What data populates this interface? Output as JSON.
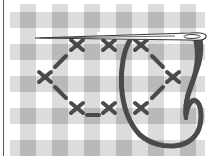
{
  "illustration": {
    "subject": "Needle and thread cross-stitching on gingham fabric",
    "caption": "",
    "colors": {
      "background": "#ffffff",
      "gingham_light": "#dcdcdc",
      "gingham_dark": "#b9b9b9",
      "thread": "#4a4a4a",
      "needle_outline": "#3a3a3a",
      "needle_fill": "#ffffff",
      "border": "#555555"
    },
    "gingham": {
      "horizontal_bands_y": [
        12,
        44,
        76,
        108,
        140
      ],
      "vertical_bands_x": [
        20,
        52,
        84,
        116,
        148,
        180
      ],
      "band_size": 16
    },
    "stitches": {
      "crosses": [
        {
          "x": 77,
          "y": 45
        },
        {
          "x": 109,
          "y": 45
        },
        {
          "x": 141,
          "y": 45
        },
        {
          "x": 45,
          "y": 77
        },
        {
          "x": 173,
          "y": 77
        },
        {
          "x": 77,
          "y": 108
        },
        {
          "x": 109,
          "y": 108
        },
        {
          "x": 141,
          "y": 108
        }
      ],
      "dashes": [
        {
          "x1": 55,
          "y1": 67,
          "x2": 66,
          "y2": 56
        },
        {
          "x1": 55,
          "y1": 87,
          "x2": 66,
          "y2": 98
        },
        {
          "x1": 152,
          "y1": 56,
          "x2": 163,
          "y2": 67
        },
        {
          "x1": 152,
          "y1": 98,
          "x2": 163,
          "y2": 87
        },
        {
          "x1": 87,
          "y1": 115,
          "x2": 99,
          "y2": 115
        }
      ]
    }
  }
}
